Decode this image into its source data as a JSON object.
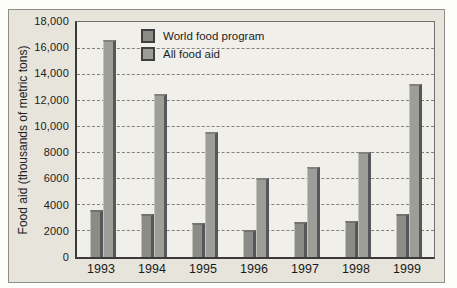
{
  "chart_data": {
    "type": "bar",
    "title": "",
    "categories": [
      "1993",
      "1994",
      "1995",
      "1996",
      "1997",
      "1998",
      "1999"
    ],
    "series": [
      {
        "name": "World food program",
        "color": "#8c8c87",
        "values": [
          3600,
          3300,
          2600,
          2100,
          2700,
          2800,
          3300
        ]
      },
      {
        "name": "All food aid",
        "color": "#9e9e98",
        "values": [
          16700,
          12500,
          9600,
          6100,
          6900,
          8100,
          13300
        ]
      }
    ],
    "xlabel": "",
    "ylabel": "Food aid (thousands of metric tons)",
    "ylim": [
      0,
      18000
    ],
    "ytick_interval": 2000,
    "ytick_labels": [
      "0",
      "2000",
      "4000",
      "6000",
      "8000",
      "10,000",
      "12,000",
      "14,000",
      "16,000",
      "18,000"
    ],
    "grid": "horizontal-dashed",
    "legend_position": "top-left-inside"
  },
  "colors": {
    "figure_background": "#e6e4db",
    "plot_background": "#f0efe9",
    "axis_line": "#3a3a3a",
    "gridline": "#83827a",
    "bar_shadow": "#57565a",
    "text": "#1e1e1e"
  }
}
